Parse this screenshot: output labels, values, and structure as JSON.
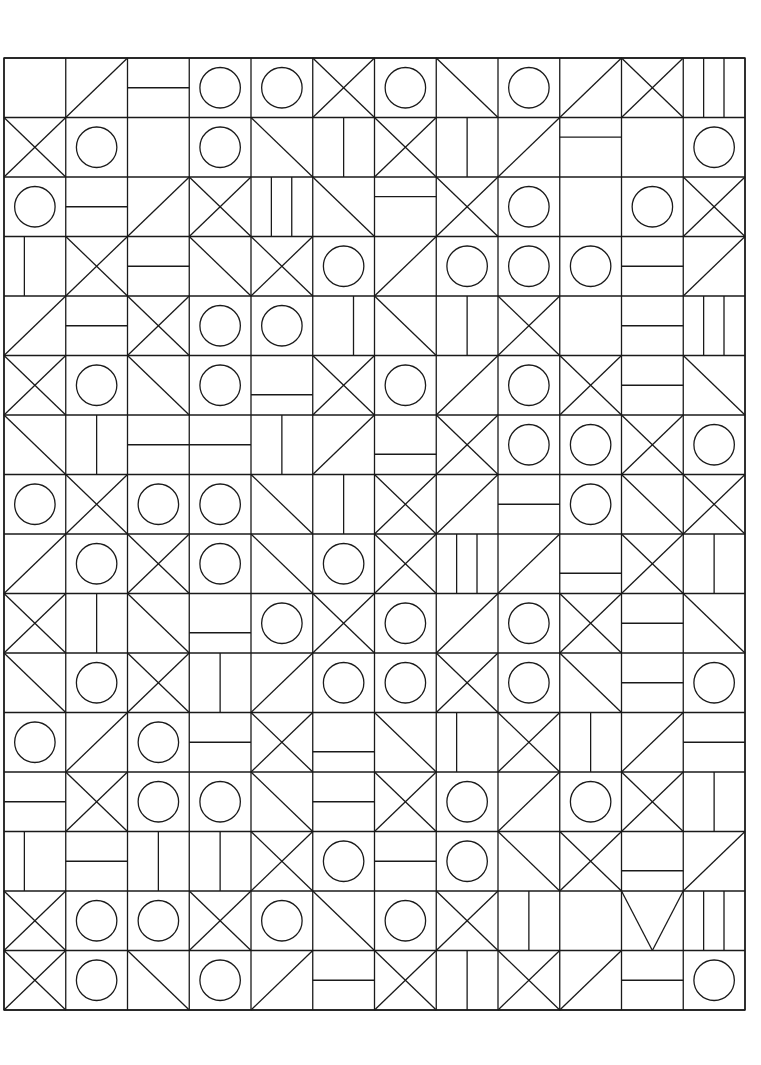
{
  "artwork": {
    "title": "Abstract Geometric Tile Grid",
    "medium": "line drawing",
    "background_color": "#ffffff",
    "stroke_color": "#1a1a1a",
    "stroke_width": 1.3,
    "circle_stroke_width": 1.3
  },
  "grid": {
    "columns": 12,
    "rows": 16,
    "origin_x": 4,
    "origin_y": 58,
    "cell_width": 61.75,
    "cell_height": 59.5,
    "total_width": 741,
    "total_height": 952,
    "draw_outer_border": true,
    "draw_cell_borders": true
  },
  "motif_legend": {
    "blank": "empty cell",
    "circle": "centered circle inscribed in cell",
    "hbar": "single horizontal bar line across cell",
    "hbar_top": "horizontal line in upper third",
    "hbar_bottom": "horizontal line in lower third",
    "vbar": "single vertical bar line down cell",
    "vbar_left": "vertical line in left third",
    "vbar_right": "vertical line in right third",
    "two_vbar": "two vertical lines splitting cell in thirds",
    "diag_tlbr": "diagonal from top-left to bottom-right",
    "diag_trbl": "diagonal from top-right to bottom-left",
    "cross": "both diagonals forming an X",
    "tri_left": "triangle pointing left (two diagonals meeting at left mid)",
    "tri_right": "triangle pointing right",
    "tri_up": "triangle pointing up",
    "tri_down": "triangle pointing down"
  },
  "tiles": [
    [
      "blank",
      "diag_trbl",
      "hbar",
      "circle",
      "circle",
      "cross",
      "circle",
      "diag_tlbr",
      "circle",
      "diag_trbl",
      "cross",
      "two_vbar"
    ],
    [
      "cross",
      "circle",
      "blank",
      "circle",
      "diag_tlbr",
      "vbar",
      "cross",
      "vbar",
      "diag_trbl",
      "hbar_top",
      "blank",
      "circle"
    ],
    [
      "circle",
      "hbar",
      "diag_trbl",
      "cross",
      "two_vbar",
      "diag_tlbr",
      "hbar_top",
      "cross",
      "circle",
      "blank",
      "circle",
      "cross"
    ],
    [
      "vbar_left",
      "cross",
      "hbar",
      "diag_tlbr",
      "cross",
      "circle",
      "diag_trbl",
      "circle",
      "circle",
      "circle",
      "hbar",
      "diag_trbl"
    ],
    [
      "diag_trbl",
      "hbar",
      "cross",
      "circle",
      "circle",
      "vbar_right",
      "diag_tlbr",
      "vbar",
      "cross",
      "blank",
      "hbar",
      "two_vbar"
    ],
    [
      "cross",
      "circle",
      "diag_tlbr",
      "circle",
      "hbar_bottom",
      "cross",
      "circle",
      "diag_trbl",
      "circle",
      "cross",
      "hbar",
      "diag_tlbr"
    ],
    [
      "diag_tlbr",
      "vbar",
      "hbar",
      "hbar",
      "vbar",
      "diag_trbl",
      "hbar_bottom",
      "cross",
      "circle",
      "circle",
      "cross",
      "circle"
    ],
    [
      "circle",
      "cross",
      "circle",
      "circle",
      "diag_tlbr",
      "vbar",
      "cross",
      "diag_trbl",
      "hbar",
      "circle",
      "diag_tlbr",
      "cross"
    ],
    [
      "diag_trbl",
      "circle",
      "cross",
      "circle",
      "diag_tlbr",
      "circle",
      "cross",
      "two_vbar",
      "diag_trbl",
      "hbar_bottom",
      "cross",
      "vbar"
    ],
    [
      "cross",
      "vbar",
      "diag_tlbr",
      "hbar_bottom",
      "circle",
      "cross",
      "circle",
      "diag_trbl",
      "circle",
      "cross",
      "hbar",
      "diag_tlbr"
    ],
    [
      "diag_tlbr",
      "circle",
      "cross",
      "vbar",
      "diag_trbl",
      "circle",
      "circle",
      "cross",
      "circle",
      "diag_tlbr",
      "hbar",
      "circle"
    ],
    [
      "circle",
      "diag_trbl",
      "circle",
      "hbar",
      "cross",
      "hbar_bottom",
      "diag_tlbr",
      "vbar_left",
      "cross",
      "vbar",
      "diag_trbl",
      "hbar"
    ],
    [
      "hbar",
      "cross",
      "circle",
      "circle",
      "diag_tlbr",
      "hbar",
      "cross",
      "circle",
      "diag_trbl",
      "circle",
      "cross",
      "vbar"
    ],
    [
      "vbar_left",
      "hbar",
      "vbar",
      "vbar",
      "cross",
      "circle",
      "hbar",
      "circle",
      "diag_tlbr",
      "cross",
      "hbar_bottom",
      "diag_trbl"
    ],
    [
      "cross",
      "circle",
      "circle",
      "cross",
      "circle",
      "diag_tlbr",
      "circle",
      "cross",
      "vbar",
      "blank",
      "tri_down",
      "two_vbar"
    ],
    [
      "cross",
      "circle",
      "diag_tlbr",
      "circle",
      "diag_trbl",
      "hbar",
      "cross",
      "vbar",
      "cross",
      "diag_trbl",
      "hbar",
      "circle"
    ]
  ],
  "extra_strokes": {
    "description": "Long diagonals that span multiple tiles forming large chevrons and zigzag bands across the composition",
    "count": 0
  }
}
